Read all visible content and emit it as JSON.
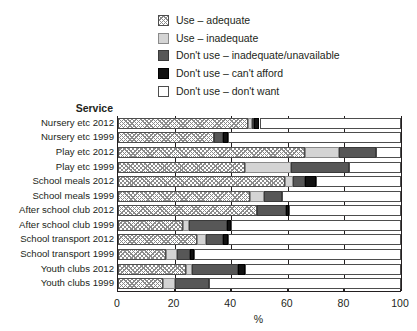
{
  "chart_data": {
    "type": "bar",
    "orientation": "horizontal",
    "stacked": true,
    "title": "",
    "xlabel": "%",
    "ylabel": "Service",
    "xlim": [
      0,
      100
    ],
    "xticks": [
      0,
      20,
      40,
      60,
      80,
      100
    ],
    "xtick_labels": [
      "0",
      "20",
      "40",
      "60",
      "80",
      "100"
    ],
    "grid": true,
    "legend_position": "top-right",
    "series": [
      {
        "name": "Use – adequate",
        "swatch": "hatch",
        "color": "#ffffff"
      },
      {
        "name": "Use – inadequate",
        "swatch": "lightgray",
        "color": "#d4d4d4"
      },
      {
        "name": "Don't use – inadequate/unavailable",
        "swatch": "darkgray",
        "color": "#575757"
      },
      {
        "name": "Don't use – can't afford",
        "swatch": "black",
        "color": "#121212"
      },
      {
        "name": "Don't use – don't want",
        "swatch": "white",
        "color": "#ffffff"
      }
    ],
    "categories": [
      "Nursery etc 2012",
      "Nursery etc 1999",
      "Play etc 2012",
      "Play etc 1999",
      "School meals 2012",
      "School meals 1999",
      "After school club 2012",
      "After school club 1999",
      "School transport 2012",
      "School transport 1999",
      "Youth clubs 2012",
      "Youth clubs 1999"
    ],
    "values": [
      [
        46,
        1.5,
        0.5,
        2,
        50
      ],
      [
        34,
        0,
        3,
        2,
        61
      ],
      [
        66,
        12,
        13,
        0,
        9
      ],
      [
        45,
        16,
        20.5,
        0,
        18.5
      ],
      [
        59,
        3,
        4,
        4,
        30
      ],
      [
        46.5,
        5,
        6.5,
        0,
        42
      ],
      [
        49,
        0,
        10.5,
        1,
        39.5
      ],
      [
        23,
        2,
        13.5,
        1.5,
        60
      ],
      [
        28,
        3,
        6,
        2,
        61
      ],
      [
        17,
        4,
        4.5,
        1.5,
        73
      ],
      [
        24,
        2,
        16.5,
        2.5,
        55
      ],
      [
        16,
        4,
        12,
        0,
        68
      ]
    ]
  }
}
